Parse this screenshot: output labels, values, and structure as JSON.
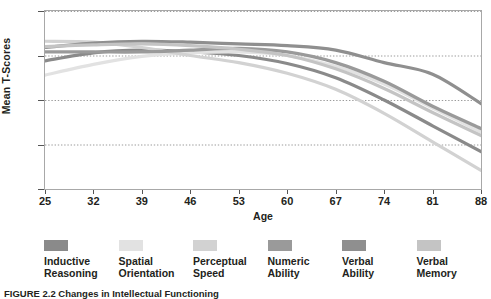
{
  "chart_data": {
    "type": "line",
    "title": "",
    "xlabel": "Age",
    "ylabel": "Mean T-Scores",
    "xlim": [
      25,
      88
    ],
    "ylim": [
      35,
      55
    ],
    "x_ticks": [
      25,
      32,
      39,
      46,
      53,
      60,
      67,
      74,
      81,
      88
    ],
    "y_ticks": [
      35,
      40,
      45,
      50,
      55
    ],
    "grid": true,
    "grid_style": "dotted-horizontal",
    "legend_position": "bottom",
    "x": [
      25,
      32,
      39,
      46,
      53,
      60,
      67,
      74,
      81,
      88
    ],
    "series": [
      {
        "name": "Inductive Reasoning",
        "color": "#8a8a8a",
        "values": [
          49.4,
          50.3,
          50.6,
          50.4,
          50.0,
          49.1,
          47.5,
          45.0,
          42.1,
          39.2
        ]
      },
      {
        "name": "Spatial Orientation",
        "color": "#e2e2e2",
        "values": [
          47.8,
          49.0,
          49.9,
          50.3,
          50.4,
          50.0,
          48.8,
          46.8,
          44.1,
          41.4
        ]
      },
      {
        "name": "Perceptual Speed",
        "color": "#d2d2d2",
        "values": [
          51.6,
          51.5,
          50.9,
          50.0,
          49.2,
          48.0,
          46.2,
          43.5,
          40.3,
          37.1
        ]
      },
      {
        "name": "Numeric Ability",
        "color": "#9a9a9a",
        "values": [
          50.4,
          50.4,
          50.4,
          50.6,
          50.8,
          50.4,
          49.2,
          47.1,
          44.3,
          41.8
        ]
      },
      {
        "name": "Verbal Ability",
        "color": "#8f8f8f",
        "values": [
          50.9,
          51.4,
          51.6,
          51.5,
          51.3,
          51.1,
          50.6,
          49.2,
          47.9,
          44.6
        ]
      },
      {
        "name": "Verbal Memory",
        "color": "#c4c4c4",
        "values": [
          51.0,
          51.2,
          51.3,
          51.1,
          50.7,
          50.0,
          48.5,
          46.3,
          43.6,
          41.0
        ]
      }
    ]
  },
  "axes": {
    "y_title": "Mean T-Scores",
    "x_title": "Age",
    "y_tick_labels": [
      "55",
      "50",
      "45",
      "40",
      "35"
    ],
    "x_tick_labels": [
      "25",
      "32",
      "39",
      "46",
      "53",
      "60",
      "67",
      "74",
      "81",
      "88"
    ]
  },
  "legend": {
    "items": [
      {
        "label_line1": "Inductive",
        "label_line2": "Reasoning",
        "color": "#8a8a8a"
      },
      {
        "label_line1": "Spatial",
        "label_line2": "Orientation",
        "color": "#e2e2e2"
      },
      {
        "label_line1": "Perceptual",
        "label_line2": "Speed",
        "color": "#d2d2d2"
      },
      {
        "label_line1": "Numeric",
        "label_line2": "Ability",
        "color": "#9a9a9a"
      },
      {
        "label_line1": "Verbal",
        "label_line2": "Ability",
        "color": "#8f8f8f"
      },
      {
        "label_line1": "Verbal",
        "label_line2": "Memory",
        "color": "#c4c4c4"
      }
    ]
  },
  "caption": {
    "text": "FIGURE 2.2  Changes in Intellectual Functioning"
  }
}
